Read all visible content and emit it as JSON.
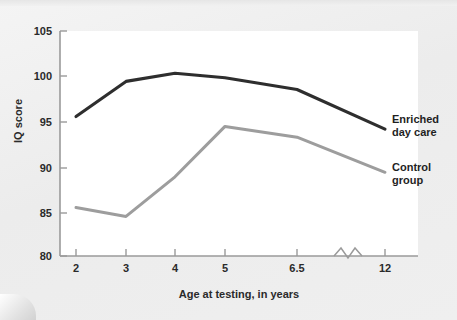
{
  "chart_data": {
    "type": "line",
    "title": "",
    "xlabel": "Age at testing, in years",
    "ylabel": "IQ score",
    "categories": [
      "2",
      "3",
      "4",
      "5",
      "6.5",
      "12"
    ],
    "x_tick_labels": [
      "2",
      "3",
      "4",
      "5",
      "6.5",
      "12"
    ],
    "y_tick_labels": [
      "80",
      "85",
      "90",
      "95",
      "100",
      "105"
    ],
    "ylim": [
      80,
      105
    ],
    "yticks": [
      80,
      85,
      90,
      95,
      100,
      105
    ],
    "grid": false,
    "legend_position": "right-inline",
    "axis_break": true,
    "axis_break_note": "zigzag break on x-axis between 6.5 and 12",
    "series": [
      {
        "name": "Enriched day care",
        "color": "#2e2e2e",
        "label_text": "Enriched\nday care",
        "values": [
          95.5,
          99.4,
          100.3,
          99.8,
          98.5,
          94.1
        ]
      },
      {
        "name": "Control group",
        "color": "#9d9d9d",
        "label_text": "Control\ngroup",
        "values": [
          85.4,
          84.4,
          88.8,
          94.4,
          93.2,
          89.3
        ]
      }
    ]
  },
  "colors": {
    "page_background": "#eeeeee",
    "plot_background": "#ffffff",
    "axis": "#9a9a9a",
    "enriched_series": "#2e2e2e",
    "control_series": "#9d9d9d",
    "text": "#2a2a2a"
  }
}
